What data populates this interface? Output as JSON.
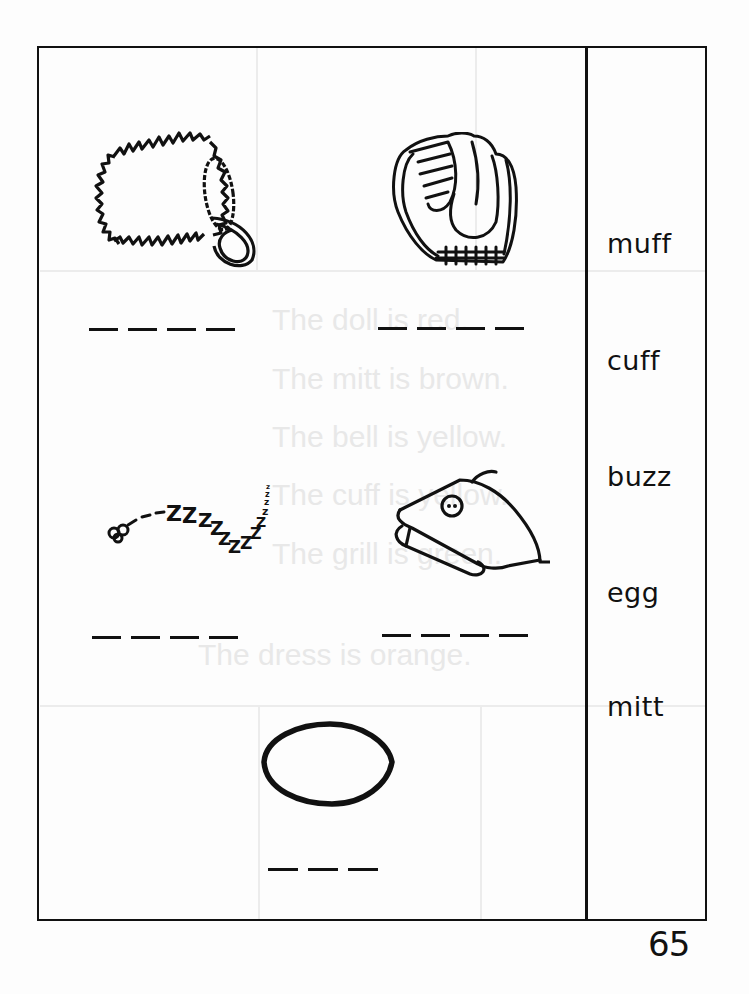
{
  "worksheet": {
    "page_number": "65",
    "word_bank": [
      {
        "word": "muff"
      },
      {
        "word": "cuff"
      },
      {
        "word": "buzz"
      },
      {
        "word": "egg"
      },
      {
        "word": "mitt"
      }
    ],
    "pictures": [
      {
        "name": "muff",
        "answer_blanks": 4
      },
      {
        "name": "mitt",
        "answer_blanks": 4
      },
      {
        "name": "buzz",
        "answer_blanks": 4
      },
      {
        "name": "cuff",
        "answer_blanks": 4
      },
      {
        "name": "egg",
        "answer_blanks": 3
      }
    ],
    "bleed_through_text": [
      "The doll is red.",
      "The mitt is brown.",
      "The bell is yellow.",
      "The cuff is yellow.",
      "The grill is green.",
      "The dress is orange."
    ]
  }
}
